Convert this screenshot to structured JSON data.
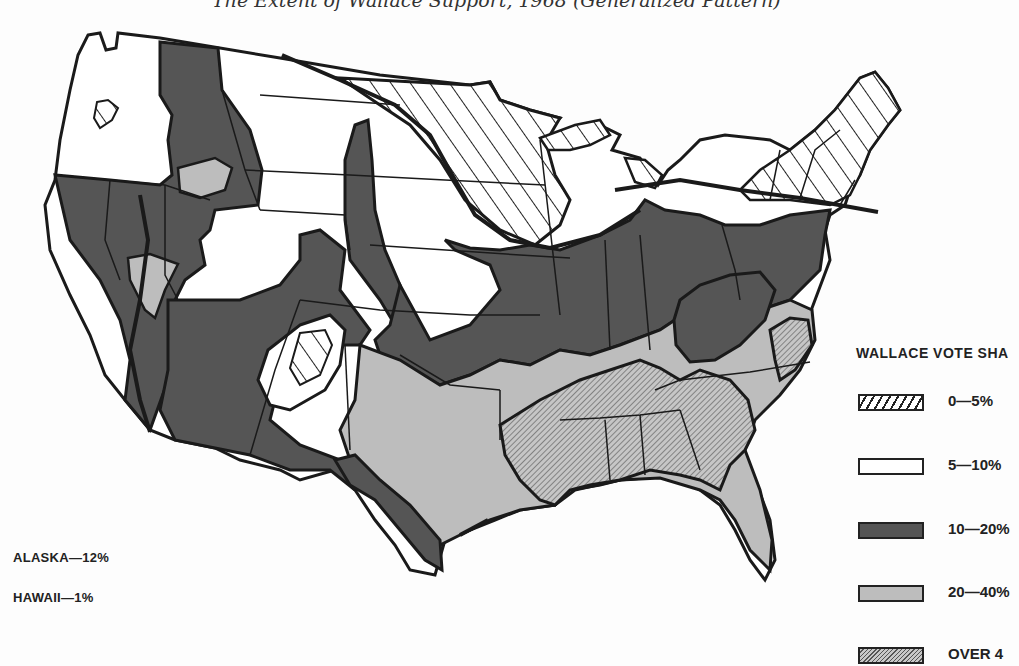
{
  "title": "The Extent of Wallace Support, 1968 (Generalized Pattern)",
  "legend": {
    "title": "WALLACE VOTE SHA",
    "items": [
      {
        "key": "low",
        "label": "0—5%",
        "pattern": "diagonal-hatch",
        "color": "#ffffff"
      },
      {
        "key": "mid",
        "label": "5—10%",
        "pattern": "solid",
        "color": "#ffffff"
      },
      {
        "key": "dark",
        "label": "10—20%",
        "pattern": "solid",
        "color": "#555555"
      },
      {
        "key": "gray",
        "label": "20—40%",
        "pattern": "solid",
        "color": "#bdbdbd"
      },
      {
        "key": "high",
        "label": "OVER 4",
        "pattern": "fine-hatch",
        "color": "#9a9a9a"
      }
    ]
  },
  "notes": {
    "alaska": "ALASKA—12%",
    "hawaii": "HAWAII—1%"
  },
  "colors": {
    "outline": "#1a1a1a",
    "dark_fill": "#555555",
    "gray_fill": "#bdbdbd",
    "background": "#fdfdfd"
  }
}
